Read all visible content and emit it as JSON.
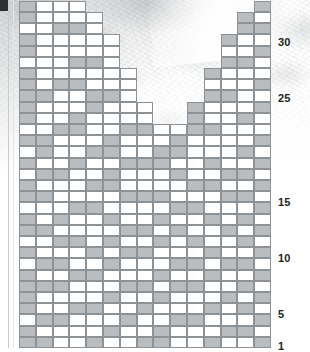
{
  "document": {
    "kind": "knitting-chart",
    "description": "Stitch pattern chart for a V-neck garment front, worked bottom-up",
    "corner_mark": "",
    "background": "mottled grey marble paper texture"
  },
  "colors": {
    "grid_line": "#8d9296",
    "cell_empty": "#ffffff",
    "cell_filled": "#b9bdc0",
    "label_text": "#231f20",
    "corner_mark": "#2d2f31",
    "margin_rule": "#c9ccce"
  },
  "chart_data": {
    "type": "heatmap",
    "title": "",
    "xlabel": "",
    "ylabel": "",
    "columns": 15,
    "rows": 31,
    "cell_width": 16.8,
    "cell_height": 11.2,
    "legend": [
      {
        "label": "empty stitch",
        "color": "#ffffff"
      },
      {
        "label": "filled stitch",
        "color": "#b9bdc0"
      }
    ],
    "row_labels": [
      {
        "row": 30,
        "text": "30",
        "y": 37
      },
      {
        "row": 25,
        "text": "25",
        "y": 93
      },
      {
        "row": 15,
        "text": "15",
        "y": 197
      },
      {
        "row": 10,
        "text": "10",
        "y": 253
      },
      {
        "row": 5,
        "text": "5",
        "y": 309
      },
      {
        "row": 1,
        "text": "1",
        "y": 341
      }
    ],
    "row_extents": [
      {
        "row": 31,
        "start": 0,
        "end": 3
      },
      {
        "row": 30,
        "start": 0,
        "end": 4
      },
      {
        "row": 29,
        "start": 0,
        "end": 4
      },
      {
        "row": 28,
        "start": 0,
        "end": 5
      },
      {
        "row": 27,
        "start": 0,
        "end": 5
      },
      {
        "row": 26,
        "start": 0,
        "end": 5
      },
      {
        "row": 25,
        "start": 0,
        "end": 6
      },
      {
        "row": 24,
        "start": 0,
        "end": 6
      },
      {
        "row": 23,
        "start": 0,
        "end": 6
      },
      {
        "row": 22,
        "start": 0,
        "end": 7
      },
      {
        "row": 21,
        "start": 0,
        "end": 7
      },
      {
        "row": 20,
        "start": 0,
        "end": 8
      },
      {
        "row": 19,
        "start": 0,
        "end": 8
      },
      {
        "row": 18,
        "start": 0,
        "end": 9
      },
      {
        "row": 17,
        "start": 0,
        "end": 14
      },
      {
        "row": 16,
        "start": 0,
        "end": 14
      },
      {
        "row": 15,
        "start": 0,
        "end": 14
      },
      {
        "row": 14,
        "start": 0,
        "end": 14
      },
      {
        "row": 13,
        "start": 0,
        "end": 14
      },
      {
        "row": 12,
        "start": 0,
        "end": 14
      },
      {
        "row": 11,
        "start": 0,
        "end": 14
      },
      {
        "row": 10,
        "start": 0,
        "end": 14
      },
      {
        "row": 9,
        "start": 0,
        "end": 14
      },
      {
        "row": 8,
        "start": 0,
        "end": 14
      },
      {
        "row": 7,
        "start": 0,
        "end": 14
      },
      {
        "row": 6,
        "start": 0,
        "end": 14
      },
      {
        "row": 5,
        "start": 0,
        "end": 14
      },
      {
        "row": 4,
        "start": 0,
        "end": 14
      },
      {
        "row": 3,
        "start": 0,
        "end": 14
      },
      {
        "row": 2,
        "start": 0,
        "end": 14
      },
      {
        "row": 1,
        "start": 0,
        "end": 14
      }
    ],
    "notch": {
      "shape": "V-neck",
      "note": "upper rows split into left and right shoulder panels",
      "right_panel_extents": [
        {
          "row": 31,
          "start": 14,
          "end": 14
        },
        {
          "row": 30,
          "start": 13,
          "end": 14
        },
        {
          "row": 29,
          "start": 13,
          "end": 14
        },
        {
          "row": 28,
          "start": 12,
          "end": 14
        },
        {
          "row": 27,
          "start": 12,
          "end": 14
        },
        {
          "row": 26,
          "start": 12,
          "end": 14
        },
        {
          "row": 25,
          "start": 11,
          "end": 14
        },
        {
          "row": 24,
          "start": 11,
          "end": 14
        },
        {
          "row": 23,
          "start": 11,
          "end": 14
        },
        {
          "row": 22,
          "start": 10,
          "end": 14
        },
        {
          "row": 21,
          "start": 10,
          "end": 14
        },
        {
          "row": 20,
          "start": 9,
          "end": 14
        },
        {
          "row": 19,
          "start": 9,
          "end": 14
        },
        {
          "row": 18,
          "start": 8,
          "end": 14
        }
      ]
    },
    "filled_cells": [
      [
        31,
        0
      ],
      [
        31,
        14
      ],
      [
        30,
        0
      ],
      [
        30,
        13
      ],
      [
        29,
        2
      ],
      [
        29,
        3
      ],
      [
        29,
        13
      ],
      [
        29,
        14
      ],
      [
        28,
        0
      ],
      [
        28,
        12
      ],
      [
        27,
        0
      ],
      [
        27,
        14
      ],
      [
        26,
        3
      ],
      [
        26,
        4
      ],
      [
        26,
        12
      ],
      [
        26,
        13
      ],
      [
        25,
        0
      ],
      [
        25,
        11
      ],
      [
        24,
        0
      ],
      [
        24,
        2
      ],
      [
        24,
        3
      ],
      [
        24,
        14
      ],
      [
        23,
        0
      ],
      [
        23,
        1
      ],
      [
        23,
        4
      ],
      [
        23,
        5
      ],
      [
        23,
        11
      ],
      [
        23,
        12
      ],
      [
        22,
        0
      ],
      [
        22,
        4
      ],
      [
        22,
        10
      ],
      [
        22,
        14
      ],
      [
        21,
        0
      ],
      [
        21,
        3
      ],
      [
        21,
        10
      ],
      [
        21,
        13
      ],
      [
        20,
        2
      ],
      [
        20,
        3
      ],
      [
        20,
        6
      ],
      [
        20,
        7
      ],
      [
        20,
        10
      ],
      [
        20,
        11
      ],
      [
        19,
        0
      ],
      [
        19,
        1
      ],
      [
        19,
        5
      ],
      [
        19,
        9
      ],
      [
        19,
        14
      ],
      [
        18,
        1
      ],
      [
        18,
        4
      ],
      [
        18,
        5
      ],
      [
        18,
        8
      ],
      [
        18,
        9
      ],
      [
        18,
        13
      ],
      [
        17,
        0
      ],
      [
        17,
        3
      ],
      [
        17,
        6
      ],
      [
        17,
        7
      ],
      [
        17,
        8
      ],
      [
        17,
        11
      ],
      [
        17,
        14
      ],
      [
        16,
        1
      ],
      [
        16,
        2
      ],
      [
        16,
        5
      ],
      [
        16,
        9
      ],
      [
        16,
        12
      ],
      [
        16,
        13
      ],
      [
        15,
        0
      ],
      [
        15,
        4
      ],
      [
        15,
        5
      ],
      [
        15,
        10
      ],
      [
        15,
        11
      ],
      [
        15,
        14
      ],
      [
        14,
        0
      ],
      [
        14,
        1
      ],
      [
        14,
        6
      ],
      [
        14,
        7
      ],
      [
        14,
        8
      ],
      [
        14,
        12
      ],
      [
        14,
        13
      ],
      [
        13,
        3
      ],
      [
        13,
        4
      ],
      [
        13,
        9
      ],
      [
        13,
        10
      ],
      [
        13,
        14
      ],
      [
        12,
        0
      ],
      [
        12,
        2
      ],
      [
        12,
        5
      ],
      [
        12,
        8
      ],
      [
        12,
        11
      ],
      [
        12,
        13
      ],
      [
        11,
        0
      ],
      [
        11,
        1
      ],
      [
        11,
        6
      ],
      [
        11,
        7
      ],
      [
        11,
        9
      ],
      [
        11,
        12
      ],
      [
        11,
        14
      ],
      [
        10,
        2
      ],
      [
        10,
        3
      ],
      [
        10,
        5
      ],
      [
        10,
        8
      ],
      [
        10,
        10
      ],
      [
        10,
        13
      ],
      [
        9,
        0
      ],
      [
        9,
        4
      ],
      [
        9,
        6
      ],
      [
        9,
        7
      ],
      [
        9,
        11
      ],
      [
        9,
        14
      ],
      [
        8,
        1
      ],
      [
        8,
        2
      ],
      [
        8,
        5
      ],
      [
        8,
        9
      ],
      [
        8,
        10
      ],
      [
        8,
        12
      ],
      [
        8,
        13
      ],
      [
        7,
        0
      ],
      [
        7,
        3
      ],
      [
        7,
        4
      ],
      [
        7,
        8
      ],
      [
        7,
        11
      ],
      [
        7,
        14
      ],
      [
        6,
        0
      ],
      [
        6,
        1
      ],
      [
        6,
        2
      ],
      [
        6,
        6
      ],
      [
        6,
        7
      ],
      [
        6,
        9
      ],
      [
        6,
        10
      ],
      [
        6,
        13
      ],
      [
        5,
        0
      ],
      [
        5,
        5
      ],
      [
        5,
        8
      ],
      [
        5,
        12
      ],
      [
        5,
        14
      ],
      [
        4,
        0
      ],
      [
        4,
        3
      ],
      [
        4,
        4
      ],
      [
        4,
        7
      ],
      [
        4,
        11
      ],
      [
        4,
        13
      ],
      [
        3,
        1
      ],
      [
        3,
        2
      ],
      [
        3,
        6
      ],
      [
        3,
        9
      ],
      [
        3,
        10
      ],
      [
        3,
        14
      ],
      [
        2,
        0
      ],
      [
        2,
        5
      ],
      [
        2,
        8
      ],
      [
        2,
        12
      ],
      [
        2,
        13
      ],
      [
        1,
        0
      ],
      [
        1,
        1
      ],
      [
        1,
        4
      ],
      [
        1,
        7
      ],
      [
        1,
        8
      ],
      [
        1,
        11
      ],
      [
        1,
        14
      ]
    ]
  }
}
